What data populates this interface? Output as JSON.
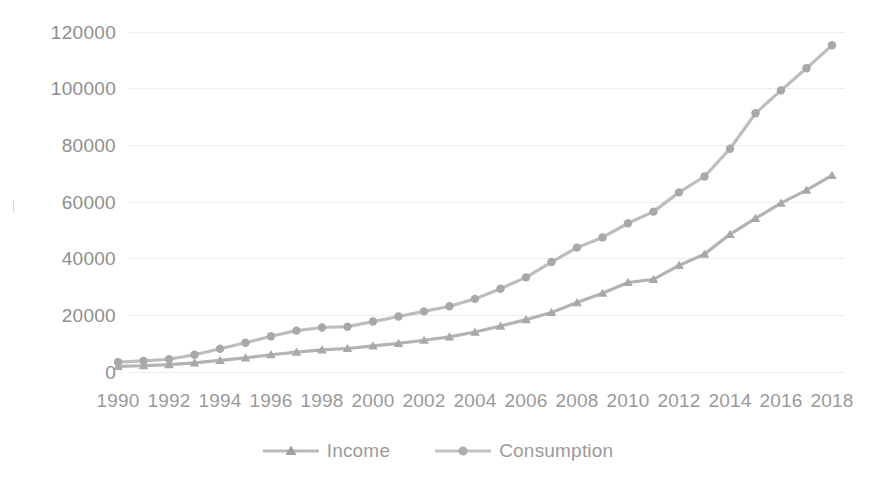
{
  "chart_data": {
    "type": "line",
    "title": "",
    "subtitle": "",
    "xlabel": "",
    "ylabel": "",
    "x": [
      1990,
      1991,
      1992,
      1993,
      1994,
      1995,
      1996,
      1997,
      1998,
      1999,
      2000,
      2001,
      2002,
      2003,
      2004,
      2005,
      2006,
      2007,
      2008,
      2009,
      2010,
      2011,
      2012,
      2013,
      2014,
      2015,
      2016,
      2017,
      2018
    ],
    "xtick_labels": [
      "1990",
      "1992",
      "1994",
      "1996",
      "1998",
      "2000",
      "2002",
      "2004",
      "2006",
      "2008",
      "2010",
      "2012",
      "2014",
      "2016",
      "2018"
    ],
    "ytick_labels": [
      "0",
      "20000",
      "40000",
      "60000",
      "80000",
      "100000",
      "120000"
    ],
    "yticks": [
      0,
      20000,
      40000,
      60000,
      80000,
      100000,
      120000
    ],
    "ylim": [
      0,
      126000
    ],
    "xlim": [
      1990,
      2018
    ],
    "grid": true,
    "grid_axis": "y",
    "legend_position": "bottom",
    "series": [
      {
        "name": "Income",
        "marker": "triangle",
        "color": "#b3b3b3",
        "values": [
          2000,
          2200,
          2600,
          3200,
          4100,
          5000,
          6100,
          7000,
          7800,
          8300,
          9200,
          10100,
          11200,
          12400,
          14100,
          16200,
          18500,
          21000,
          24500,
          27800,
          31600,
          32700,
          37600,
          41600,
          48600,
          54200,
          59600,
          64200,
          69400
        ]
      },
      {
        "name": "Consumption",
        "marker": "circle",
        "color": "#bdbdbd",
        "values": [
          3500,
          3900,
          4500,
          6100,
          8200,
          10300,
          12600,
          14600,
          15700,
          16000,
          17800,
          19600,
          21400,
          23200,
          25800,
          29400,
          33400,
          38800,
          43900,
          47500,
          52500,
          56600,
          63400,
          69000,
          78800,
          91300,
          99400,
          107200,
          115300
        ]
      }
    ]
  },
  "axis": {
    "y_labels": [
      "120000",
      "100000",
      "80000",
      "60000",
      "40000",
      "20000",
      "0"
    ],
    "x_labels": [
      "1990",
      "1992",
      "1994",
      "1996",
      "1998",
      "2000",
      "2002",
      "2004",
      "2006",
      "2008",
      "2010",
      "2012",
      "2014",
      "2016",
      "2018"
    ]
  },
  "legend": {
    "items": [
      {
        "label": "Income",
        "marker": "triangle-marker-icon"
      },
      {
        "label": "Consumption",
        "marker": "circle-marker-icon"
      }
    ]
  },
  "style": {
    "line_color": "#b5b5b5",
    "grid_color": "#ededed",
    "text_color": "#9a9a9a",
    "background": "#ffffff"
  }
}
